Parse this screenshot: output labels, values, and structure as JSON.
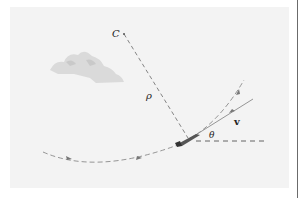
{
  "figure": {
    "labels": {
      "center": "C",
      "radius": "ρ",
      "angle": "θ",
      "velocity": "v"
    },
    "elements": [
      "cloud",
      "airplane",
      "flight-path",
      "radius-of-curvature",
      "velocity-tangent",
      "horizontal-reference"
    ],
    "colors": {
      "panel_background": "#f3f3f3",
      "line": "#777777",
      "text": "#222222",
      "cloud": "#d9d9d9",
      "frame_rule": "#6b6b6b"
    }
  }
}
